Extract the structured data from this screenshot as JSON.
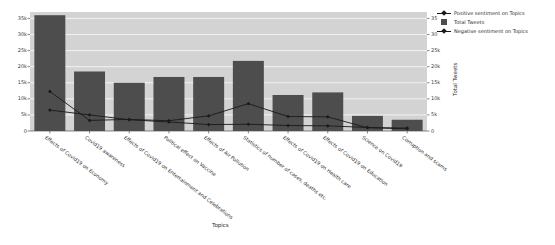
{
  "chart_data": {
    "type": "bar",
    "title": "",
    "xlabel": "Topics",
    "ylabel": "",
    "ylabel_right": "Total Tweets",
    "grid": true,
    "legend_position": "upper right",
    "ylim": [
      0,
      37000
    ],
    "ylim_right": [
      0,
      37000
    ],
    "yticks": [
      0,
      5000,
      10000,
      15000,
      20000,
      25000,
      30000,
      35000
    ],
    "ytick_labels": [
      "0",
      "5k",
      "10k",
      "15k",
      "20k",
      "25k",
      "30k",
      "35k"
    ],
    "ytick_labels_right": [
      "0",
      "5k",
      "10k",
      "15k",
      "20k",
      "25k",
      "30",
      "35"
    ],
    "categories": [
      "Effects of Covid19 on Economy",
      "Covid19 awareness",
      "Effects of Covid19 on Entertainment and Celebrations",
      "Political effect on Vaccine",
      "Effects of Air Pollution",
      "Statistics of number of cases, deaths etc.",
      "Effects of Covid19 on Health care",
      "Effects of Covid19 on Education",
      "Science on Covid19",
      "Corruption and scams"
    ],
    "series": [
      {
        "name": "Total Tweets",
        "kind": "bar",
        "color": "#4d4d4d",
        "values": [
          36000,
          18500,
          15000,
          16800,
          16800,
          21800,
          11200,
          12000,
          4700,
          3500
        ]
      },
      {
        "name": "Positive sentiment on Topics",
        "kind": "line",
        "color": "#1a1a1a",
        "values": [
          12300,
          3300,
          3600,
          3200,
          4700,
          8500,
          4500,
          4400,
          1000,
          700
        ]
      },
      {
        "name": "Negative sentiment on Topics",
        "kind": "line",
        "color": "#1a1a1a",
        "values": [
          6500,
          5000,
          3500,
          2800,
          2000,
          2100,
          1700,
          1600,
          1100,
          900
        ]
      }
    ]
  },
  "legend": {
    "items": [
      {
        "label": "Positive sentiment on Topics",
        "marker": "line-marker"
      },
      {
        "label": "Total Tweets",
        "marker": "square-patch"
      },
      {
        "label": "Negative sentiment on Topics",
        "marker": "line-marker"
      }
    ]
  },
  "axes": {
    "x_title": "Topics",
    "y_right_title": "Total Tweets"
  }
}
